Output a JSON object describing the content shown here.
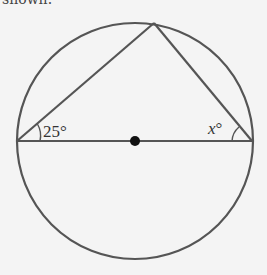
{
  "caption_fragment": "shown.",
  "diagram": {
    "type": "circle-inscribed-triangle",
    "circle": {
      "cx": 135,
      "cy": 141,
      "r": 118
    },
    "diameter": {
      "x1": 17,
      "y1": 141,
      "x2": 252,
      "y2": 141
    },
    "apex": {
      "x": 154,
      "y": 23
    },
    "center_point": {
      "x": 135,
      "y": 141
    },
    "labels": {
      "left_angle": "25°",
      "right_angle_var": "x",
      "right_angle_deg": "°"
    },
    "stroke_color": "#555555",
    "background": "#f4f4f4"
  }
}
